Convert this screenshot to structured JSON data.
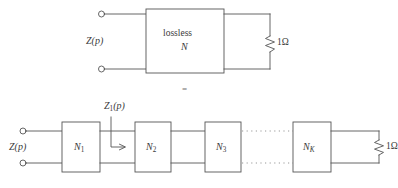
{
  "figure": {
    "name": "cascade-equivalence-diagram",
    "stroke_color": "#555555",
    "text_color": "#3a3a3a",
    "background": "#ffffff",
    "equals_sign": "="
  },
  "top_circuit": {
    "name": "lossless-two-port-terminated",
    "port_label": "Z(p)",
    "port_label_var": "Z",
    "port_label_arg": "(p)",
    "box_line1": "lossless",
    "box_line2": "N",
    "load_value": "1",
    "load_unit": "Ω",
    "load_label": "1Ω"
  },
  "bottom_circuit": {
    "name": "cascade-of-sections",
    "port_label": "Z(p)",
    "intermediate_label_var": "Z",
    "intermediate_label_sub": "1",
    "intermediate_label_arg": "(p)",
    "intermediate_label": "Z₁(p)",
    "sections": [
      {
        "name": "N1",
        "symbol": "N",
        "subscript": "1"
      },
      {
        "name": "N2",
        "symbol": "N",
        "subscript": "2"
      },
      {
        "name": "N3",
        "symbol": "N",
        "subscript": "3"
      },
      {
        "name": "NK",
        "symbol": "N",
        "subscript": "K"
      }
    ],
    "ellipsis": "dotted-continuation",
    "load_value": "1",
    "load_unit": "Ω",
    "load_label": "1Ω"
  }
}
